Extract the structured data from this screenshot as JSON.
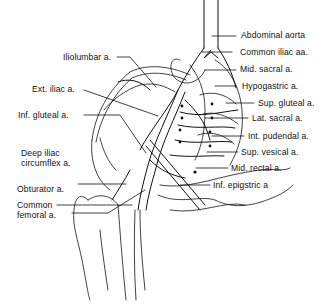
{
  "diagram": {
    "colors": {
      "background": "#ffffff",
      "ink": "#111111"
    },
    "labels_left": [
      {
        "id": "iliolumbar",
        "text": "Iliolumbar a."
      },
      {
        "id": "ext-iliac",
        "text": "Ext. iliac a."
      },
      {
        "id": "inf-gluteal",
        "text": "Inf. gluteal a."
      },
      {
        "id": "deep-iliac-circumflex",
        "text": "Deep iliac\ncircumflex a."
      },
      {
        "id": "obturator",
        "text": "Obturator a."
      },
      {
        "id": "common-femoral",
        "text": "Common\nfemoral a."
      }
    ],
    "labels_right": [
      {
        "id": "abdominal-aorta",
        "text": "Abdominal aorta"
      },
      {
        "id": "common-iliac",
        "text": "Common iliac aa."
      },
      {
        "id": "mid-sacral",
        "text": "Mid. sacral a."
      },
      {
        "id": "hypogastric",
        "text": "Hypogastric a."
      },
      {
        "id": "sup-gluteal",
        "text": "Sup. gluteal a."
      },
      {
        "id": "lat-sacral",
        "text": "Lat. sacral a."
      },
      {
        "id": "int-pudendal",
        "text": "Int. pudendal a."
      },
      {
        "id": "sup-vesical",
        "text": "Sup. vesical a."
      },
      {
        "id": "mid-rectal",
        "text": "Mid. rectal a."
      },
      {
        "id": "inf-epigastric",
        "text": "Inf. epigstric a"
      }
    ]
  }
}
